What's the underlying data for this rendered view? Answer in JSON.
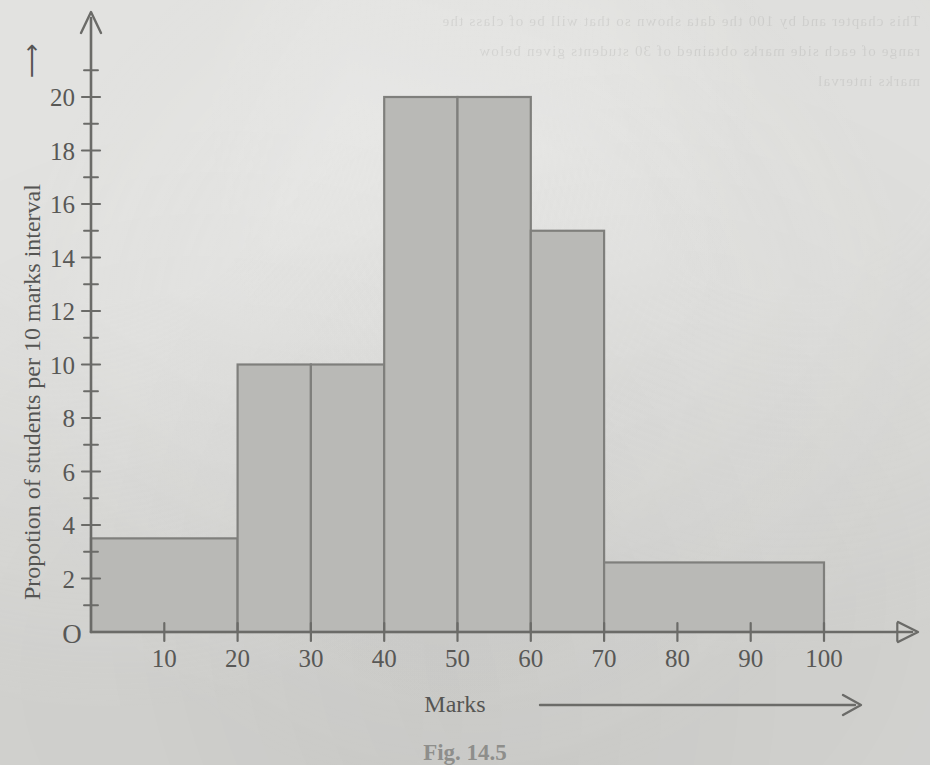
{
  "page": {
    "background_color": "#d7d7d4",
    "ink_color": "#585856",
    "ghost_bleed_text": "This chapter and by 100 the data shown so that will be of class the range of each side marks obtained of 30 students given below marks interval"
  },
  "figure": {
    "caption": "Fig. 14.5",
    "origin_label": "O"
  },
  "chart_data": {
    "type": "bar",
    "title": "",
    "subtitle": "",
    "xlabel": "Marks",
    "ylabel": "Propotion of students per 10 marks interval",
    "xlabel_arrow": "⟶",
    "ylabel_arrow": "⟶",
    "grid": false,
    "legend": "none",
    "xlim": [
      0,
      110
    ],
    "ylim": [
      0,
      22
    ],
    "x_ticks": [
      10,
      20,
      30,
      40,
      50,
      60,
      70,
      80,
      90,
      100
    ],
    "x_tick_labels": [
      "10",
      "20",
      "30",
      "40",
      "50",
      "60",
      "70",
      "80",
      "90",
      "100"
    ],
    "y_ticks": [
      2,
      4,
      6,
      8,
      10,
      12,
      14,
      16,
      18,
      20
    ],
    "y_tick_labels": [
      "2",
      "4",
      "6",
      "8",
      "10",
      "12",
      "14",
      "16",
      "18",
      "20"
    ],
    "y_minor_ticks": [
      1,
      3,
      5,
      7,
      9,
      11,
      13,
      15,
      17,
      19,
      21
    ],
    "x_extra_ticks": [
      110
    ],
    "bar_fill_color": "#b9b9b6",
    "bar_edge_color": "#7f7f7c",
    "bins": [
      {
        "label": "0-20",
        "x_start": 0,
        "x_end": 20,
        "height": 3.5
      },
      {
        "label": "20-30",
        "x_start": 20,
        "x_end": 30,
        "height": 10.0
      },
      {
        "label": "30-40",
        "x_start": 30,
        "x_end": 40,
        "height": 10.0
      },
      {
        "label": "40-50",
        "x_start": 40,
        "x_end": 50,
        "height": 20.0
      },
      {
        "label": "50-60",
        "x_start": 50,
        "x_end": 60,
        "height": 20.0
      },
      {
        "label": "60-70",
        "x_start": 60,
        "x_end": 70,
        "height": 15.0
      },
      {
        "label": "70-100",
        "x_start": 70,
        "x_end": 100,
        "height": 2.6
      }
    ]
  }
}
